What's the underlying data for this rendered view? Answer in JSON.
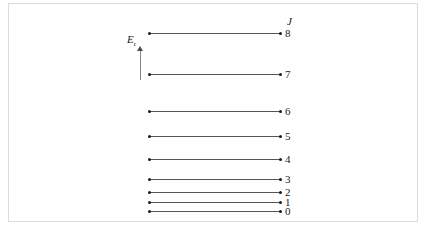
{
  "figure": {
    "type": "energy-level-diagram",
    "background_color": "#ffffff",
    "frame_color": "#dcdcdc",
    "line_color": "#555555",
    "dot_color": "#1a1a1a",
    "text_color": "#1a1a1a"
  },
  "axis": {
    "energy_symbol": "E",
    "energy_subscript": "r",
    "arrow_direction": "up"
  },
  "quantum_number_header": "J",
  "chart_data": {
    "type": "line",
    "title": "",
    "subtitle": "",
    "xlabel": "",
    "ylabel": "E_r",
    "grid": false,
    "legend": "none",
    "series_label": "J",
    "categories": [
      "0",
      "1",
      "2",
      "3",
      "4",
      "5",
      "6",
      "7",
      "8"
    ],
    "levels": [
      {
        "label": "0",
        "y": 210
      },
      {
        "label": "1",
        "y": 201
      },
      {
        "label": "2",
        "y": 191
      },
      {
        "label": "3",
        "y": 178
      },
      {
        "label": "4",
        "y": 158
      },
      {
        "label": "5",
        "y": 135
      },
      {
        "label": "6",
        "y": 110
      },
      {
        "label": "7",
        "y": 73
      },
      {
        "label": "8",
        "y": 32
      }
    ],
    "line_x_start": 148,
    "line_x_end": 279
  }
}
